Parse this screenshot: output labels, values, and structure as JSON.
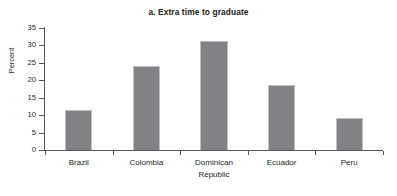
{
  "chart_data": {
    "type": "bar",
    "title": "a. Extra time to graduate",
    "xlabel": "",
    "ylabel": "Percent",
    "categories": [
      "Brazil",
      "Colombia",
      "Dominican Republic",
      "Ecuador",
      "Peru"
    ],
    "category_lines": [
      [
        "Brazil"
      ],
      [
        "Colombia"
      ],
      [
        "Dominican",
        "Republic"
      ],
      [
        "Ecuador"
      ],
      [
        "Peru"
      ]
    ],
    "values": [
      11.5,
      24.2,
      31.2,
      18.7,
      9.2
    ],
    "ylim": [
      0,
      35
    ],
    "ytick_values": [
      0,
      5,
      10,
      15,
      20,
      25,
      30,
      35
    ],
    "ytick_labels": [
      "0",
      "5",
      "10",
      "15",
      "20",
      "25",
      "30",
      "35"
    ],
    "grid": false,
    "legend": null,
    "bar_color": "#808285",
    "axis_color": "#58595b",
    "background_color": "#ffffff"
  }
}
